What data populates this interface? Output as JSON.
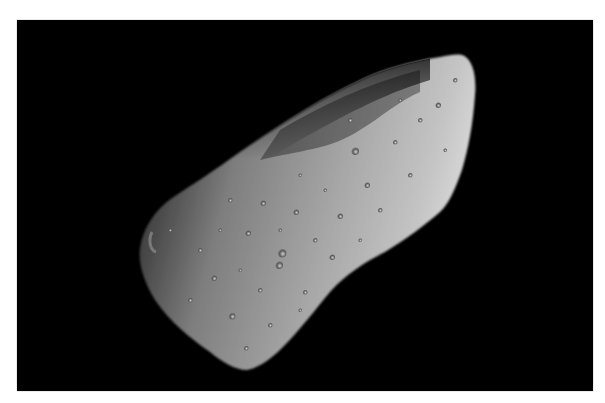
{
  "image": {
    "subject": "asteroid",
    "description": "Grayscale photograph of an elongated, cratered asteroid against a black sky, illuminated from the right",
    "colors": {
      "background": "#000000",
      "border": "#ffffff",
      "surface_light": "#c8c8c8",
      "surface_mid": "#8a8a8a",
      "surface_dark": "#2a2a2a"
    }
  }
}
